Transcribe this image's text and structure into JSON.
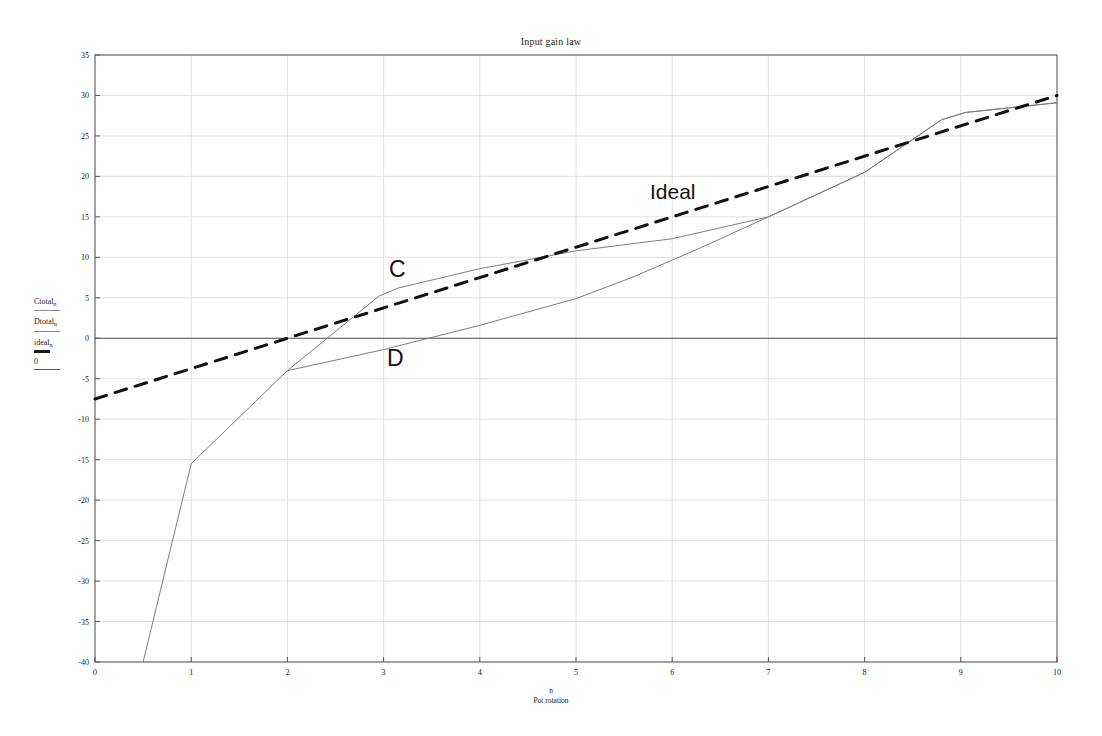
{
  "chart_data": {
    "type": "line",
    "title": "Input gain law",
    "xlabel": "Pot rotation",
    "xlabel_symbol": "n",
    "ylabel": "",
    "xlim": [
      0,
      10
    ],
    "ylim": [
      -40,
      35
    ],
    "xticks": [
      0,
      1,
      2,
      3,
      4,
      5,
      6,
      7,
      8,
      9,
      10
    ],
    "yticks": [
      -40,
      -35,
      -30,
      -25,
      -20,
      -15,
      -10,
      -5,
      0,
      5,
      10,
      15,
      20,
      25,
      30,
      35
    ],
    "grid": true,
    "legend_position": "left-margin",
    "zero_line": 0,
    "series": [
      {
        "name": "Ctotal",
        "name_sub": "n",
        "label_on_plot": "C",
        "style": "solid",
        "color": "#7d7d7d",
        "width": 1,
        "points": [
          [
            0.5,
            -40.0
          ],
          [
            1.0,
            -15.5
          ],
          [
            2.0,
            -4.0
          ],
          [
            2.95,
            5.2
          ],
          [
            3.15,
            6.2
          ],
          [
            4.0,
            8.6
          ],
          [
            5.0,
            10.8
          ],
          [
            6.0,
            12.3
          ],
          [
            7.0,
            15.0
          ],
          [
            8.0,
            20.5
          ],
          [
            8.8,
            27.0
          ],
          [
            9.05,
            27.9
          ],
          [
            10.0,
            29.1
          ]
        ]
      },
      {
        "name": "Dtotal",
        "name_sub": "n",
        "label_on_plot": "D",
        "style": "solid",
        "color": "#7d7d7d",
        "width": 1,
        "points": [
          [
            2.0,
            -4.0
          ],
          [
            3.0,
            -1.4
          ],
          [
            4.0,
            1.6
          ],
          [
            5.0,
            4.9
          ],
          [
            5.6,
            7.6
          ],
          [
            6.3,
            11.2
          ],
          [
            7.0,
            15.0
          ],
          [
            8.0,
            20.5
          ],
          [
            8.8,
            27.0
          ],
          [
            9.05,
            27.9
          ],
          [
            10.0,
            29.1
          ]
        ]
      },
      {
        "name": "ideal",
        "name_sub": "n",
        "label_on_plot": "Ideal",
        "style": "dashed",
        "color": "#111111",
        "width": 3,
        "points": [
          [
            0.0,
            -7.5
          ],
          [
            10.0,
            30.0
          ]
        ]
      }
    ],
    "annotations": [
      {
        "text": "C",
        "x": 3.0,
        "y": 7.5
      },
      {
        "text": "D",
        "x": 3.0,
        "y": -2.5
      },
      {
        "text": "Ideal",
        "x": 6.0,
        "y": 19.0
      }
    ]
  },
  "legend": {
    "items": [
      {
        "label": "Ctotal",
        "sub": "n",
        "key": "thin-line-key"
      },
      {
        "label": "Dtotal",
        "sub": "n",
        "key": "thin-line-key"
      },
      {
        "label": "ideal",
        "sub": "n",
        "key": "thick-dash-key"
      },
      {
        "label": "0",
        "sub": "",
        "key": "zero-line-key"
      }
    ]
  },
  "colors": {
    "curve": "#7d7d7d",
    "ideal": "#111111",
    "axis": "#555555",
    "grid": "#d8d8d8",
    "background": "#ffffff"
  }
}
